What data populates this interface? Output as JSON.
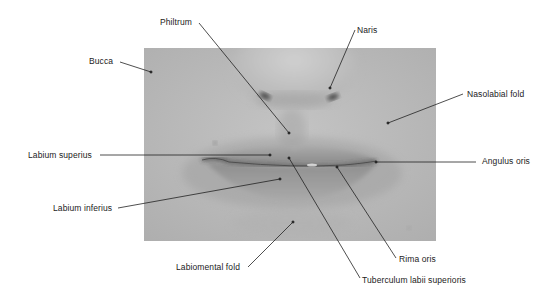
{
  "figure": {
    "photo": {
      "x": 144,
      "y": 48,
      "width": 292,
      "height": 193,
      "tone": "#b9b9b9"
    },
    "line_color": "#222222",
    "labels": [
      {
        "id": "philtrum",
        "text": "Philtrum",
        "x": 160,
        "y": 17,
        "line": [
          199,
          23,
          289,
          133
        ]
      },
      {
        "id": "naris",
        "text": "Naris",
        "x": 357,
        "y": 25,
        "line": [
          355,
          30,
          330,
          88
        ]
      },
      {
        "id": "bucca",
        "text": "Bucca",
        "x": 89,
        "y": 56,
        "line": [
          120,
          62,
          151,
          72
        ]
      },
      {
        "id": "nasolabial-fold",
        "text": "Nasolabial fold",
        "x": 467,
        "y": 89,
        "line": [
          463,
          94,
          388,
          123
        ]
      },
      {
        "id": "labium-superius",
        "text": "Labium superius",
        "x": 28,
        "y": 150,
        "line": [
          100,
          155,
          270,
          155
        ]
      },
      {
        "id": "angulus-oris",
        "text": "Angulus oris",
        "x": 482,
        "y": 156,
        "line": [
          476,
          162,
          376,
          162
        ]
      },
      {
        "id": "labium-inferius",
        "text": "Labium inferius",
        "x": 53,
        "y": 203,
        "line": [
          118,
          208,
          280,
          179
        ]
      },
      {
        "id": "labiomental-fold",
        "text": "Labiomental fold",
        "x": 176,
        "y": 262,
        "line": [
          248,
          267,
          293,
          222
        ]
      },
      {
        "id": "rima-oris",
        "text": "Rima oris",
        "x": 399,
        "y": 254,
        "line": [
          396,
          258,
          337,
          167
        ]
      },
      {
        "id": "tuberculum-labii-superioris",
        "text": "Tuberculum labii superioris",
        "x": 362,
        "y": 275,
        "line": [
          360,
          278,
          289,
          158
        ]
      }
    ]
  }
}
